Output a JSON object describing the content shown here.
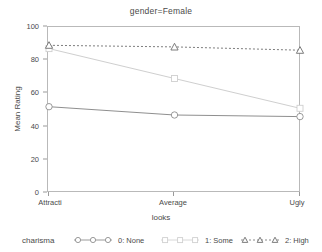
{
  "chart_data": {
    "type": "line",
    "title": "gender=Female",
    "xlabel": "looks",
    "ylabel": "Mean Rating",
    "categories": [
      "Attracti",
      "Average",
      "Ugly"
    ],
    "ylim": [
      0,
      100
    ],
    "yticks": [
      0,
      20,
      40,
      60,
      80,
      100
    ],
    "grid": false,
    "legend_position": "bottom",
    "legend_title": "charisma",
    "series": [
      {
        "name": "0: None",
        "values": [
          52,
          47,
          46
        ],
        "marker": "circle",
        "color": "#8f8f8f",
        "linestyle": "solid"
      },
      {
        "name": "1: Some",
        "values": [
          87,
          69,
          51
        ],
        "marker": "square",
        "color": "#cfcfcf",
        "linestyle": "solid"
      },
      {
        "name": "2: High",
        "values": [
          89,
          88,
          86
        ],
        "marker": "triangle",
        "color": "#6e6e6e",
        "linestyle": "dotted"
      }
    ]
  },
  "axis": {
    "y_tick_labels": [
      "100",
      "80",
      "60",
      "40",
      "20",
      "0"
    ],
    "x_tick_labels": [
      "Attracti",
      "Average",
      "Ugly"
    ]
  }
}
